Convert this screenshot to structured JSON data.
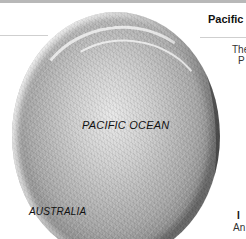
{
  "page": {
    "header": {
      "title": "Pacific"
    },
    "body_text": {
      "line1": "The",
      "line2": "P",
      "line3": "I",
      "line4": "An"
    },
    "map": {
      "type": "relief-globe",
      "labels": {
        "ocean": "PACIFIC OCEAN",
        "continent": "AUSTRALIA"
      },
      "colors": {
        "globe_light": "#e8e8e8",
        "globe_mid": "#a9a9a9",
        "globe_dark": "#2e2e2e",
        "top_strip": "#b8b8b8",
        "rule": "#cfcfcf"
      }
    }
  }
}
